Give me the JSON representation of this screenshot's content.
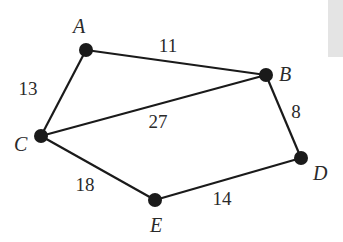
{
  "diagram": {
    "type": "weighted-undirected-graph",
    "nodes": [
      {
        "id": "A",
        "label": "A",
        "x": 86,
        "y": 50,
        "label_x": 73,
        "label_y": 33
      },
      {
        "id": "B",
        "label": "B",
        "x": 266,
        "y": 75,
        "label_x": 279,
        "label_y": 81
      },
      {
        "id": "C",
        "label": "C",
        "x": 41,
        "y": 136,
        "label_x": 14,
        "label_y": 151
      },
      {
        "id": "D",
        "label": "D",
        "x": 301,
        "y": 158,
        "label_x": 313,
        "label_y": 180
      },
      {
        "id": "E",
        "label": "E",
        "x": 155,
        "y": 200,
        "label_x": 150,
        "label_y": 232
      }
    ],
    "edges": [
      {
        "from": "A",
        "to": "B",
        "weight": "11",
        "wx": 168,
        "wy": 52
      },
      {
        "from": "A",
        "to": "C",
        "weight": "13",
        "wx": 28,
        "wy": 95
      },
      {
        "from": "C",
        "to": "B",
        "weight": "27",
        "wx": 158,
        "wy": 128
      },
      {
        "from": "B",
        "to": "D",
        "weight": "8",
        "wx": 296,
        "wy": 118
      },
      {
        "from": "C",
        "to": "E",
        "weight": "18",
        "wx": 85,
        "wy": 191
      },
      {
        "from": "E",
        "to": "D",
        "weight": "14",
        "wx": 222,
        "wy": 205
      }
    ]
  },
  "colors": {
    "line": "#1a1a1a",
    "text": "#2a2a2a",
    "strip": "#e4e4e4"
  }
}
